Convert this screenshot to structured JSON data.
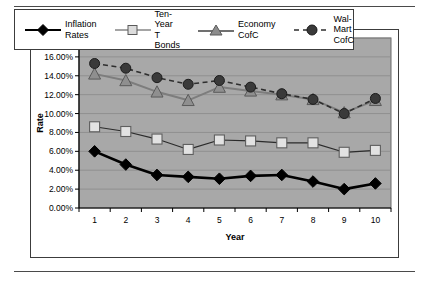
{
  "figure": {
    "background": "#ffffff",
    "plot_background": "#a8a8a8",
    "border_color": "#3c3c3c"
  },
  "legend": {
    "position": "top",
    "entries": [
      {
        "label": "Inflation\nRates",
        "key": "diamond-marker",
        "color": "#000000",
        "line": "solid"
      },
      {
        "label": "Ten-Year\nT Bonds",
        "key": "square-marker",
        "color": "#d9d9d9",
        "line": "solid"
      },
      {
        "label": "Economy\nCofC",
        "key": "triangle-marker",
        "color": "#8c8c8c",
        "line": "solid"
      },
      {
        "label": "Wal-Mart\nCofC",
        "key": "circle-marker",
        "color": "#3a3a3a",
        "line": "dashed"
      }
    ]
  },
  "chart_data": {
    "type": "line",
    "title": "",
    "xlabel": "Year",
    "ylabel": "Rate",
    "categories": [
      "1",
      "2",
      "3",
      "4",
      "5",
      "6",
      "7",
      "8",
      "9",
      "10"
    ],
    "x": [
      1,
      2,
      3,
      4,
      5,
      6,
      7,
      8,
      9,
      10
    ],
    "ylim": [
      0,
      18
    ],
    "ytick_step": 2,
    "ytick_labels": [
      "0.00%",
      "2.00%",
      "4.00%",
      "6.00%",
      "8.00%",
      "10.00%",
      "12.00%",
      "14.00%",
      "16.00%",
      "18.00%"
    ],
    "ytick_values": [
      0,
      2,
      4,
      6,
      8,
      10,
      12,
      14,
      16,
      18
    ],
    "grid": "horizontal",
    "legend_position": "top",
    "series": [
      {
        "name": "Inflation Rates",
        "marker": "diamond",
        "color": "#000000",
        "line_style": "solid",
        "values": [
          6.0,
          4.6,
          3.5,
          3.3,
          3.1,
          3.4,
          3.5,
          2.8,
          2.0,
          2.6
        ]
      },
      {
        "name": "Ten-Year T Bonds",
        "marker": "square",
        "color": "#d9d9d9",
        "line_style": "solid",
        "values": [
          8.6,
          8.1,
          7.3,
          6.2,
          7.2,
          7.1,
          6.9,
          6.9,
          5.9,
          6.1
        ]
      },
      {
        "name": "Economy CofC",
        "marker": "triangle",
        "color": "#8c8c8c",
        "line_style": "solid",
        "values": [
          14.2,
          13.5,
          12.3,
          11.4,
          12.8,
          12.4,
          12.0,
          11.5,
          10.1,
          11.4
        ]
      },
      {
        "name": "Wal-Mart CofC",
        "marker": "circle",
        "color": "#3a3a3a",
        "line_style": "dashed",
        "values": [
          15.3,
          14.8,
          13.8,
          13.1,
          13.5,
          12.8,
          12.1,
          11.5,
          10.0,
          11.6
        ]
      }
    ]
  }
}
